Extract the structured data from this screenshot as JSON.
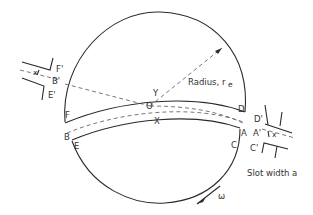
{
  "figure": {
    "type": "slotted rotating disk / cylinder schematic",
    "stroke_color": "#2a2a2a",
    "background": "#ffffff"
  },
  "labels": {
    "F_prime": "F'",
    "B_prime": "B'",
    "E_prime": "E'",
    "x_left": "x",
    "F": "F",
    "B": "B",
    "E": "E",
    "Y": "Y",
    "O": "O",
    "X": "X",
    "D": "D",
    "A": "A",
    "C": "C",
    "D_prime": "D'",
    "A_prime": "A'",
    "C_prime": "C'",
    "x_right": "x",
    "radius": "Radius, r",
    "radius_sub": "e",
    "slot_width": "Slot width a",
    "omega": "ω"
  }
}
